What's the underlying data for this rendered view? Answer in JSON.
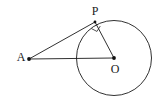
{
  "figure": {
    "background_color": "#ffffff",
    "stroke_color": "#1a1a1a",
    "label_color": "#1a1a1a",
    "width": 157,
    "height": 104,
    "labels": {
      "point_a": "A",
      "point_p": "P",
      "point_o": "O"
    },
    "points": {
      "a": {
        "x": 29,
        "y": 59
      },
      "p": {
        "x": 95,
        "y": 22
      },
      "o": {
        "x": 114,
        "y": 58
      }
    },
    "circle": {
      "center_x": 114,
      "center_y": 58,
      "radius": 37.5
    },
    "segments": [
      {
        "name": "tangent-ap",
        "from": "a",
        "to": "p"
      },
      {
        "name": "secant-ao",
        "from": "a",
        "to": "o"
      },
      {
        "name": "radius-po",
        "from": "p",
        "to": "o"
      }
    ],
    "right_angle_marker": {
      "at": "p",
      "size": 7
    },
    "label_positions": {
      "a": {
        "x": 21,
        "y": 58
      },
      "p": {
        "x": 95,
        "y": 12
      },
      "o": {
        "x": 115,
        "y": 70
      }
    }
  }
}
